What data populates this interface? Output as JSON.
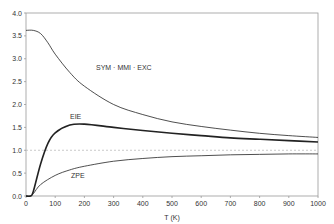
{
  "chart_data": {
    "type": "line",
    "title": "",
    "xlabel": "T (K)",
    "ylabel": "",
    "xlim": [
      0,
      1000
    ],
    "ylim": [
      0,
      4.0
    ],
    "x_ticks": [
      "0",
      "100",
      "200",
      "300",
      "400",
      "500",
      "600",
      "700",
      "800",
      "900",
      "1000"
    ],
    "y_ticks": [
      "0.0",
      "0.5",
      "1.0",
      "1.5",
      "2.0",
      "2.5",
      "3.0",
      "3.5",
      "4.0"
    ],
    "grid": false,
    "reference_line": {
      "y": 1.0,
      "style": "dashed"
    },
    "series": [
      {
        "name": "SYM · MMI · EXC",
        "x": [
          0,
          25,
          50,
          75,
          100,
          150,
          200,
          300,
          400,
          500,
          600,
          700,
          800,
          900,
          1000
        ],
        "values": [
          3.62,
          3.62,
          3.55,
          3.35,
          3.1,
          2.7,
          2.4,
          2.0,
          1.78,
          1.62,
          1.52,
          1.44,
          1.37,
          1.32,
          1.28
        ]
      },
      {
        "name": "EIE",
        "x": [
          0,
          15,
          25,
          50,
          75,
          100,
          150,
          200,
          300,
          400,
          500,
          600,
          700,
          800,
          900,
          1000
        ],
        "values": [
          0,
          0,
          0.1,
          0.7,
          1.15,
          1.38,
          1.55,
          1.57,
          1.5,
          1.43,
          1.37,
          1.32,
          1.27,
          1.24,
          1.21,
          1.18
        ]
      },
      {
        "name": "ZPE",
        "x": [
          0,
          15,
          25,
          50,
          100,
          150,
          200,
          300,
          400,
          500,
          600,
          700,
          800,
          900,
          1000
        ],
        "values": [
          0,
          0,
          0.05,
          0.25,
          0.45,
          0.57,
          0.65,
          0.76,
          0.82,
          0.86,
          0.88,
          0.9,
          0.91,
          0.92,
          0.92
        ]
      }
    ],
    "annotations": [
      "SYM · MMI · EXC",
      "EIE",
      "ZPE"
    ]
  }
}
